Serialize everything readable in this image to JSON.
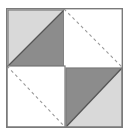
{
  "figure": {
    "kind": "geometric-tile-diagram",
    "canvas": {
      "width": 129,
      "height": 134
    },
    "colors": {
      "background": "#ffffff",
      "light_gray": "#d9d9d9",
      "dark_gray": "#8c8c8c",
      "outline": "#7a7a7a",
      "inner_outline": "#555555",
      "dashed_line": "#9a9a9a"
    },
    "outer_square": {
      "label": "outer square border",
      "x": 6,
      "y": 8,
      "width": 117,
      "height": 120,
      "stroke_width": 1.4,
      "fill": "#ffffff"
    },
    "quadrants": [
      {
        "id": "top-left",
        "label": "Top-left shaded square",
        "x": 8,
        "y": 10,
        "width": 56,
        "height": 56,
        "diagonal": "bottom-left-to-top-right",
        "upper_left_half_color": "#d9d9d9",
        "lower_right_half_color": "#8c8c8c",
        "shaded": true,
        "dashed": false
      },
      {
        "id": "top-right",
        "label": "Top-right white square with dashed diagonal",
        "x": 64,
        "y": 9,
        "width": 58,
        "height": 58,
        "diagonal": "top-left-to-bottom-right",
        "upper_left_half_color": "#ffffff",
        "lower_right_half_color": "#ffffff",
        "shaded": false,
        "dashed": true
      },
      {
        "id": "bottom-left",
        "label": "Bottom-left white square with dashed diagonal",
        "x": 7,
        "y": 66,
        "width": 58,
        "height": 61,
        "diagonal": "top-left-to-bottom-right",
        "upper_left_half_color": "#ffffff",
        "lower_right_half_color": "#ffffff",
        "shaded": false,
        "dashed": true
      },
      {
        "id": "bottom-right",
        "label": "Bottom-right shaded square",
        "x": 66,
        "y": 68,
        "width": 56,
        "height": 59,
        "diagonal": "bottom-left-to-top-right",
        "upper_left_half_color": "#8c8c8c",
        "lower_right_half_color": "#d9d9d9",
        "shaded": true,
        "dashed": false
      }
    ],
    "dashed_style": {
      "dash_array": "3 3",
      "stroke_width": 1.1
    }
  }
}
